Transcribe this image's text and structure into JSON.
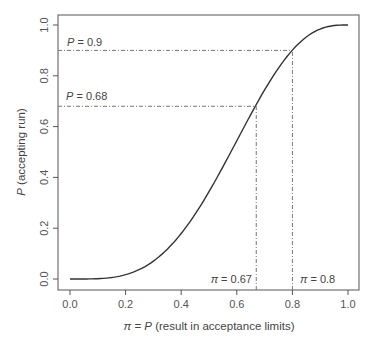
{
  "chart_data": {
    "type": "line",
    "title": "",
    "xlabel": "π = P (result in acceptance limits)",
    "ylabel": "P (accepting run)",
    "xlim": [
      0,
      1
    ],
    "ylim": [
      0,
      1
    ],
    "x_ticks": [
      "0.0",
      "0.2",
      "0.4",
      "0.6",
      "0.8",
      "1.0"
    ],
    "y_ticks": [
      "0.0",
      "0.2",
      "0.4",
      "0.6",
      "0.8",
      "1.0"
    ],
    "grid": false,
    "legend": null,
    "series": [
      {
        "name": "P (accepting run)",
        "x": [
          0.0,
          0.1,
          0.2,
          0.3,
          0.4,
          0.5,
          0.6,
          0.67,
          0.7,
          0.8,
          0.9,
          1.0
        ],
        "values": [
          0.0,
          0.001,
          0.017,
          0.07,
          0.179,
          0.344,
          0.544,
          0.687,
          0.744,
          0.901,
          0.984,
          1.0
        ]
      }
    ],
    "annotations": [
      {
        "type": "hline",
        "y": 0.9,
        "x_end": 0.8,
        "label": "P = 0.9",
        "style": "dot-dash"
      },
      {
        "type": "hline",
        "y": 0.68,
        "x_end": 0.67,
        "label": "P = 0.68",
        "style": "dot-dash"
      },
      {
        "type": "vline",
        "x": 0.67,
        "y_end": 0.68,
        "label": "π = 0.67",
        "style": "dot-dash"
      },
      {
        "type": "vline",
        "x": 0.8,
        "y_end": 0.9,
        "label": "π = 0.8",
        "style": "dot-dash"
      }
    ]
  },
  "labels": {
    "xlabel_pi": "π",
    "xlabel_eq": " = ",
    "xlabel_P": "P",
    "xlabel_rest": " (result in acceptance limits)",
    "ylabel_P": "P",
    "ylabel_rest": " (accepting run)",
    "hline1_P": "P",
    "hline1_rest": " = 0.9",
    "hline2_P": "P",
    "hline2_rest": " = 0.68",
    "vline1_pi": "π",
    "vline1_rest": " = 0.67",
    "vline2_pi": "π",
    "vline2_rest": " = 0.8"
  },
  "colors": {
    "curve": "#333333",
    "frame": "#555555",
    "guide": "#777777"
  }
}
